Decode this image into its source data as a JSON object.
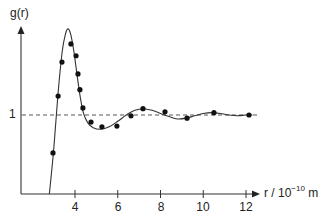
{
  "chart_data": {
    "type": "line",
    "title": "",
    "xlabel": "r / 10^-10 m",
    "xlabel_parts": {
      "prefix": "r / 10",
      "exp": "−10",
      "suffix": " m"
    },
    "ylabel": "g(r)",
    "x_ticks": [
      4,
      6,
      8,
      10,
      12
    ],
    "y_ticks": [
      1
    ],
    "xlim": [
      2,
      13
    ],
    "ylim": [
      0,
      2.1
    ],
    "grid": false,
    "reference_line": {
      "y": 1,
      "style": "dashed"
    },
    "series": [
      {
        "name": "theory curve",
        "style": "solid line",
        "x": [
          2.8,
          3.0,
          3.2,
          3.4,
          3.55,
          3.67,
          3.8,
          3.95,
          4.1,
          4.25,
          4.4,
          4.6,
          4.85,
          5.2,
          5.6,
          6.0,
          6.4,
          6.8,
          7.2,
          7.6,
          8.0,
          8.4,
          8.8,
          9.2,
          9.6,
          10.0,
          10.4,
          10.8,
          11.2,
          11.6,
          12.0,
          12.3
        ],
        "y": [
          0.0,
          0.55,
          1.25,
          1.8,
          2.02,
          2.09,
          2.02,
          1.8,
          1.5,
          1.22,
          1.02,
          0.9,
          0.84,
          0.82,
          0.85,
          0.92,
          1.0,
          1.06,
          1.08,
          1.06,
          1.02,
          0.98,
          0.95,
          0.96,
          0.99,
          1.02,
          1.03,
          1.02,
          1.0,
          0.99,
          1.0,
          1.0
        ]
      },
      {
        "name": "experimental points",
        "style": "markers",
        "x": [
          2.97,
          3.21,
          3.39,
          3.81,
          4.05,
          4.14,
          4.23,
          4.37,
          4.75,
          5.26,
          5.96,
          6.62,
          7.18,
          8.21,
          9.24,
          10.5,
          12.14
        ],
        "y": [
          0.52,
          1.24,
          1.67,
          1.9,
          1.75,
          1.52,
          1.32,
          1.09,
          0.91,
          0.85,
          0.86,
          0.99,
          1.08,
          1.04,
          0.96,
          1.03,
          1.0
        ]
      }
    ]
  },
  "labels": {
    "ylabel": "g(r)",
    "y_one": "1",
    "x_prefix": "r / 10",
    "x_exp": "−10",
    "x_suffix": " m",
    "ticks": [
      "4",
      "6",
      "8",
      "10",
      "12"
    ]
  }
}
